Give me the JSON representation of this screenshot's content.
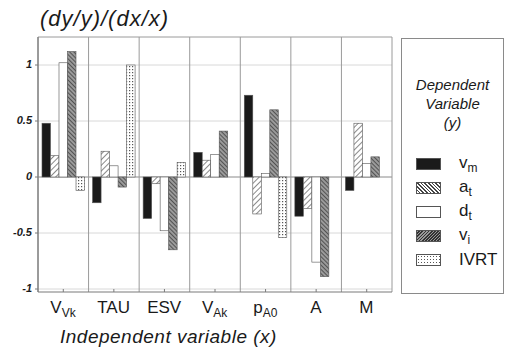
{
  "chart_data": {
    "type": "bar",
    "title": "(dy/y)/(dx/x)",
    "xlabel": "Independent variable (x)",
    "ylabel": "(dy/y)/(dx/x)",
    "ylim": [
      -1,
      1.2
    ],
    "yticks": [
      1,
      0.5,
      0,
      -0.5,
      -1
    ],
    "ytick_labels": [
      "1",
      "0.5",
      "0",
      "-0.5",
      "-1"
    ],
    "grid": "horizontal dotted at 0.5 intervals, vertical group separators",
    "legend_position": "right",
    "legend_title": "Dependent Variable (y)",
    "categories": [
      {
        "main": "V",
        "sub": "Vk"
      },
      {
        "main": "TAU",
        "sub": ""
      },
      {
        "main": "ESV",
        "sub": ""
      },
      {
        "main": "V",
        "sub": "Ak"
      },
      {
        "main": "p",
        "sub": "A0"
      },
      {
        "main": "A",
        "sub": ""
      },
      {
        "main": "M",
        "sub": ""
      }
    ],
    "series": [
      {
        "name": "v_m",
        "label_main": "v",
        "label_sub": "m",
        "pattern": "solid-black",
        "values": [
          0.48,
          -0.23,
          -0.37,
          0.22,
          0.73,
          -0.35,
          -0.12
        ]
      },
      {
        "name": "a_t",
        "label_main": "a",
        "label_sub": "t",
        "pattern": "diagonal-hatch-light",
        "values": [
          0.19,
          0.23,
          -0.06,
          0.15,
          -0.33,
          -0.28,
          0.48
        ]
      },
      {
        "name": "d_t",
        "label_main": "d",
        "label_sub": "t",
        "pattern": "white",
        "values": [
          1.02,
          0.1,
          -0.48,
          0.2,
          0.03,
          -0.76,
          0.12
        ]
      },
      {
        "name": "v_i",
        "label_main": "v",
        "label_sub": "i",
        "pattern": "diagonal-hatch-dense",
        "values": [
          1.12,
          -0.09,
          -0.65,
          0.41,
          0.6,
          -0.89,
          0.18
        ]
      },
      {
        "name": "IVRT",
        "label_main": "IVRT",
        "label_sub": "",
        "pattern": "dotted-grid",
        "values": [
          -0.12,
          1.0,
          0.13,
          0.0,
          -0.54,
          0.0,
          0.0
        ]
      }
    ]
  },
  "title_text": "(dy/y)/(dx/x)",
  "xlabel_text": "Independent variable (x)",
  "legend": {
    "title_line1": "Dependent",
    "title_line2": "Variable",
    "title_line3": "(y)"
  },
  "colors": {
    "bar_solid": "#1a1a1a",
    "axis": "#7a7a7a",
    "grid": "#d8d8d8",
    "hatch": "#4a4a4a"
  }
}
